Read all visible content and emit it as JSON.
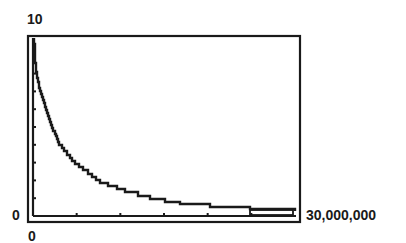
{
  "chart_data": {
    "type": "line",
    "title": "",
    "xlabel": "",
    "ylabel": "",
    "xlim": [
      0,
      30000000
    ],
    "ylim": [
      0,
      10
    ],
    "x_tick_labels": [
      "0",
      "30,000,000"
    ],
    "y_tick_labels": [
      "0",
      "10"
    ],
    "x_ticks_count": 6,
    "y_ticks_count": 10,
    "grid": false,
    "legend": null,
    "style": "step (calculator-style pixelated plot)",
    "series": [
      {
        "name": "curve",
        "x": [
          100000,
          300000,
          800000,
          2000000,
          3000000,
          4800000,
          7700000,
          10500000,
          13400000,
          16800000,
          20300000,
          24900000,
          30000000
        ],
        "y": [
          10,
          8.1,
          7.0,
          5.3,
          4.0,
          2.9,
          1.85,
          1.35,
          0.95,
          0.67,
          0.5,
          0.4,
          0.3
        ]
      }
    ]
  },
  "labels": {
    "y_max": "10",
    "y_min": "0",
    "x_min": "0",
    "x_max": "30,000,000"
  },
  "colors": {
    "line": "#1a1a1a",
    "background": "#ffffff"
  }
}
